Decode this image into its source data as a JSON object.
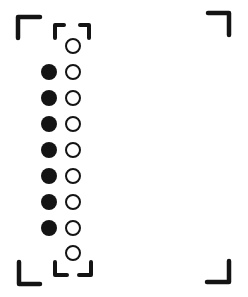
{
  "figure": {
    "colors": {
      "ink": "#141414",
      "background": "#ffffff"
    },
    "frame_corners": [
      {
        "name": "top-left",
        "points": [
          [
            18,
            38
          ],
          [
            18,
            17
          ],
          [
            40,
            17
          ]
        ]
      },
      {
        "name": "top-right",
        "points": [
          [
            208,
            13
          ],
          [
            229,
            13
          ],
          [
            229,
            35
          ]
        ]
      },
      {
        "name": "bottom-left",
        "points": [
          [
            19,
            262
          ],
          [
            19,
            284
          ],
          [
            40,
            284
          ]
        ]
      },
      {
        "name": "bottom-right",
        "points": [
          [
            207,
            282
          ],
          [
            229,
            282
          ],
          [
            229,
            261
          ]
        ]
      }
    ],
    "inner_brackets": [
      {
        "name": "inner-top-left",
        "points": [
          [
            55,
            38
          ],
          [
            55,
            25
          ],
          [
            64,
            25
          ]
        ]
      },
      {
        "name": "inner-top-right",
        "points": [
          [
            80,
            25
          ],
          [
            89,
            25
          ],
          [
            89,
            38
          ]
        ]
      },
      {
        "name": "inner-bottom-left",
        "points": [
          [
            55,
            262
          ],
          [
            55,
            275
          ],
          [
            67,
            275
          ]
        ]
      },
      {
        "name": "inner-bottom-right",
        "points": [
          [
            79,
            275
          ],
          [
            91,
            275
          ],
          [
            91,
            262
          ]
        ]
      }
    ],
    "filled_dots": {
      "cx": 49,
      "r": 8,
      "cy": [
        72,
        98,
        124,
        150,
        176,
        202,
        228
      ]
    },
    "open_circles": {
      "cx": 73,
      "r": 7,
      "cy": [
        46,
        72,
        98,
        124,
        150,
        176,
        202,
        228,
        253
      ]
    }
  }
}
